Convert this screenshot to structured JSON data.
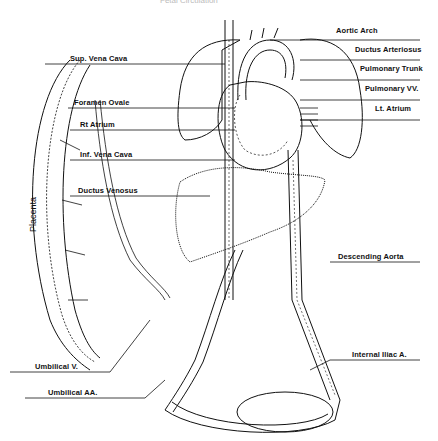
{
  "title": "Fetal Circulation",
  "labels": {
    "aortic_arch": "Aortic Arch",
    "ductus_arteriosus": "Ductus Arteriosus",
    "pulmonary_trunk": "Pulmonary Trunk",
    "pulmonary_vv": "Pulmonary VV.",
    "lt_atrium": "Lt. Atrium",
    "sup_vena_cava": "Sup. Vena Cava",
    "foramen_ovale": "Foramen Ovale",
    "rt_atrium": "Rt Atrium",
    "inf_vena_cava": "Inf. Vena Cava",
    "ductus_venosus": "Ductus Venosus",
    "descending_aorta": "Descending Aorta",
    "internal_iliac": "Internal Iliac A.",
    "umbilical_v": "Umbilical V.",
    "umbilical_aa": "Umbilical AA.",
    "placenta": "Placenta"
  }
}
